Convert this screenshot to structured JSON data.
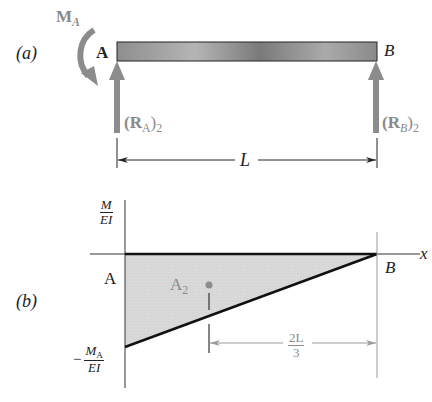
{
  "figure": {
    "part_a": {
      "label": "(a)",
      "moment_label": "M",
      "moment_sub": "A",
      "support_left": "A",
      "support_right": "B",
      "reaction_left": {
        "text": "(R",
        "sub": "A",
        "close": ")",
        "sub2": "2"
      },
      "reaction_right": {
        "text": "(R",
        "sub": "B",
        "close": ")",
        "sub2": "2"
      },
      "span_label": "L"
    },
    "part_b": {
      "label": "(b)",
      "y_axis_label": {
        "num": "M",
        "den": "EI"
      },
      "x_axis_label": "x",
      "point_left": "A",
      "point_right": "B",
      "min_value_label": {
        "prefix": "−",
        "num": "M",
        "num_sub": "A",
        "den": "EI"
      },
      "area_label": "A",
      "area_sub": "2",
      "centroid_distance": {
        "num": "2L",
        "den": "3"
      }
    },
    "colors": {
      "beam_fill": "#9a9a9a",
      "arrow_gray": "#8c8c8c",
      "area_fill": "#d8d8d8",
      "line_dark": "#111111",
      "dim_gray": "#9a9a9a"
    }
  }
}
